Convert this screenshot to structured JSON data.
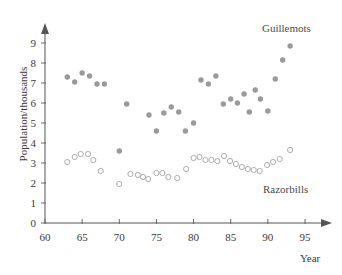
{
  "chart_data": {
    "type": "scatter",
    "title": "",
    "xlabel": "Year",
    "ylabel": "Population/thousands",
    "xlim": [
      60,
      96.5
    ],
    "ylim": [
      0,
      9.6
    ],
    "xticks": [
      60,
      65,
      70,
      75,
      80,
      85,
      90,
      95
    ],
    "yticks": [
      0,
      1,
      2,
      3,
      4,
      5,
      6,
      7,
      8,
      9
    ],
    "grid": false,
    "legend_position": "inline-annotations",
    "series": [
      {
        "name": "Guillemots",
        "marker": "filled-circle",
        "color": "#9a9a9a",
        "points": [
          [
            63.0,
            7.3
          ],
          [
            64.0,
            7.05
          ],
          [
            65.0,
            7.5
          ],
          [
            66.0,
            7.35
          ],
          [
            67.0,
            6.95
          ],
          [
            68.0,
            6.95
          ],
          [
            70.0,
            3.6
          ],
          [
            71.0,
            5.95
          ],
          [
            74.0,
            5.4
          ],
          [
            75.0,
            4.6
          ],
          [
            76.0,
            5.5
          ],
          [
            77.0,
            5.8
          ],
          [
            78.0,
            5.55
          ],
          [
            78.9,
            4.6
          ],
          [
            80.0,
            5.0
          ],
          [
            81.0,
            7.15
          ],
          [
            82.0,
            6.95
          ],
          [
            83.0,
            7.35
          ],
          [
            84.0,
            5.95
          ],
          [
            85.0,
            6.2
          ],
          [
            85.9,
            6.0
          ],
          [
            86.8,
            6.45
          ],
          [
            87.5,
            5.55
          ],
          [
            88.3,
            6.65
          ],
          [
            89.0,
            6.2
          ],
          [
            90.0,
            5.6
          ],
          [
            91.0,
            7.2
          ],
          [
            92.0,
            8.15
          ],
          [
            93.0,
            8.85
          ]
        ]
      },
      {
        "name": "Razorbills",
        "marker": "open-circle",
        "color": "#adadad",
        "points": [
          [
            63.0,
            3.05
          ],
          [
            64.0,
            3.3
          ],
          [
            64.8,
            3.45
          ],
          [
            65.8,
            3.45
          ],
          [
            66.5,
            3.15
          ],
          [
            67.5,
            2.6
          ],
          [
            70.0,
            1.95
          ],
          [
            71.5,
            2.45
          ],
          [
            72.5,
            2.4
          ],
          [
            73.2,
            2.3
          ],
          [
            73.9,
            2.2
          ],
          [
            75.0,
            2.5
          ],
          [
            75.8,
            2.5
          ],
          [
            76.6,
            2.3
          ],
          [
            77.8,
            2.25
          ],
          [
            79.0,
            2.7
          ],
          [
            80.0,
            3.25
          ],
          [
            80.8,
            3.3
          ],
          [
            81.6,
            3.15
          ],
          [
            82.4,
            3.15
          ],
          [
            83.2,
            3.1
          ],
          [
            84.1,
            3.35
          ],
          [
            84.9,
            3.1
          ],
          [
            85.7,
            2.95
          ],
          [
            86.5,
            2.8
          ],
          [
            87.3,
            2.7
          ],
          [
            88.1,
            2.65
          ],
          [
            88.9,
            2.6
          ],
          [
            89.9,
            2.9
          ],
          [
            90.7,
            3.05
          ],
          [
            91.6,
            3.2
          ],
          [
            93.0,
            3.65
          ]
        ]
      }
    ]
  },
  "annotations": {
    "guillemots_label": "Guillemots",
    "razorbills_label": "Razorbills"
  },
  "axes": {
    "x_title": "Year",
    "y_title": "Population/thousands"
  }
}
